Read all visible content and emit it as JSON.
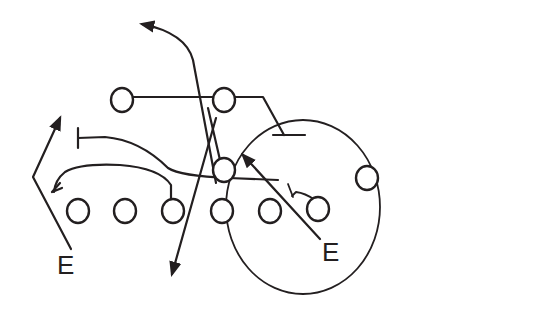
{
  "diagram": {
    "type": "football-play-diagram",
    "colors": {
      "ink": "#231f20",
      "background": "#ffffff"
    },
    "labels": [
      {
        "id": "end-left",
        "text": "E",
        "x": 66,
        "y": 274
      },
      {
        "id": "end-right",
        "text": "E",
        "x": 331,
        "y": 261
      }
    ],
    "players": [
      {
        "id": "back-left",
        "x": 122,
        "y": 100
      },
      {
        "id": "back-center",
        "x": 224,
        "y": 100
      },
      {
        "id": "linebacker-middle",
        "x": 224,
        "y": 170
      },
      {
        "id": "line-1",
        "x": 78,
        "y": 211
      },
      {
        "id": "line-2",
        "x": 125,
        "y": 211
      },
      {
        "id": "line-3",
        "x": 173,
        "y": 211
      },
      {
        "id": "line-4",
        "x": 222,
        "y": 211
      },
      {
        "id": "line-5",
        "x": 270,
        "y": 211
      },
      {
        "id": "line-6",
        "x": 318,
        "y": 209
      },
      {
        "id": "wing-right",
        "x": 367,
        "y": 178
      }
    ],
    "zone": {
      "id": "highlight-ellipse",
      "cx": 303,
      "cy": 207,
      "rx": 77,
      "ry": 87
    }
  }
}
